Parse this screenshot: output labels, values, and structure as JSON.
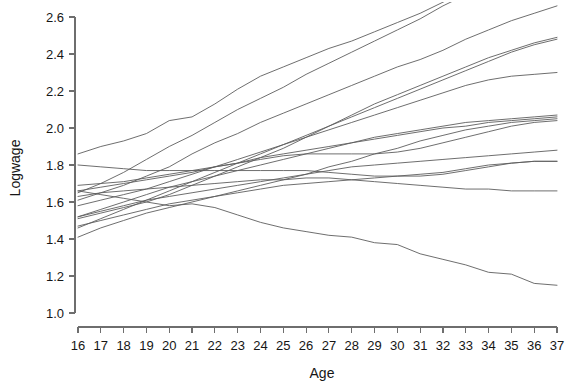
{
  "chart_data": {
    "type": "line",
    "title": "",
    "subtitle": "",
    "xlabel": "Age",
    "ylabel": "Logwage",
    "grid": false,
    "legend": "none",
    "xlim": [
      16,
      37
    ],
    "ylim": [
      1.0,
      2.6
    ],
    "y_axis_visible_max": 2.6,
    "x_ticks": [
      16,
      17,
      18,
      19,
      20,
      21,
      22,
      23,
      24,
      25,
      26,
      27,
      28,
      29,
      30,
      31,
      32,
      33,
      34,
      35,
      36,
      37
    ],
    "y_ticks": [
      1.0,
      1.2,
      1.4,
      1.6,
      1.8,
      2.0,
      2.2,
      2.4,
      2.6
    ],
    "x_tick_labels": [
      "16",
      "17",
      "18",
      "19",
      "20",
      "21",
      "22",
      "23",
      "24",
      "25",
      "26",
      "27",
      "28",
      "29",
      "30",
      "31",
      "32",
      "33",
      "34",
      "35",
      "36",
      "37"
    ],
    "y_tick_labels": [
      "1.0",
      "1.2",
      "1.4",
      "1.6",
      "1.8",
      "2.0",
      "2.2",
      "2.4",
      "2.6"
    ],
    "x": [
      16,
      17,
      18,
      19,
      20,
      21,
      22,
      23,
      24,
      25,
      26,
      27,
      28,
      29,
      30,
      31,
      32,
      33,
      34,
      35,
      36,
      37
    ],
    "line_color": "#5e5e5e",
    "series": [
      {
        "name": "subject-1",
        "values": [
          1.86,
          1.9,
          1.93,
          1.97,
          2.04,
          2.06,
          2.13,
          2.21,
          2.28,
          2.33,
          2.38,
          2.43,
          2.47,
          2.52,
          2.57,
          2.62,
          2.68,
          2.74,
          2.8,
          2.86,
          2.92,
          2.98
        ]
      },
      {
        "name": "subject-2",
        "values": [
          1.65,
          1.7,
          1.76,
          1.83,
          1.9,
          1.96,
          2.03,
          2.1,
          2.16,
          2.22,
          2.29,
          2.35,
          2.41,
          2.47,
          2.53,
          2.59,
          2.66,
          2.72,
          2.78,
          2.84,
          2.9,
          2.96
        ]
      },
      {
        "name": "subject-3",
        "values": [
          1.61,
          1.65,
          1.69,
          1.74,
          1.79,
          1.86,
          1.92,
          1.97,
          2.03,
          2.08,
          2.13,
          2.18,
          2.23,
          2.28,
          2.33,
          2.37,
          2.42,
          2.48,
          2.53,
          2.58,
          2.62,
          2.66
        ]
      },
      {
        "name": "subject-4",
        "values": [
          1.51,
          1.54,
          1.57,
          1.6,
          1.64,
          1.69,
          1.74,
          1.79,
          1.84,
          1.89,
          1.95,
          2.01,
          2.07,
          2.13,
          2.18,
          2.23,
          2.28,
          2.33,
          2.38,
          2.42,
          2.46,
          2.49
        ]
      },
      {
        "name": "subject-5",
        "values": [
          1.46,
          1.51,
          1.56,
          1.61,
          1.66,
          1.71,
          1.76,
          1.81,
          1.86,
          1.91,
          1.96,
          2.01,
          2.06,
          2.11,
          2.16,
          2.21,
          2.26,
          2.31,
          2.36,
          2.41,
          2.45,
          2.48
        ]
      },
      {
        "name": "subject-6",
        "values": [
          1.58,
          1.61,
          1.64,
          1.67,
          1.71,
          1.75,
          1.79,
          1.83,
          1.87,
          1.91,
          1.95,
          1.99,
          2.03,
          2.07,
          2.11,
          2.15,
          2.19,
          2.23,
          2.26,
          2.28,
          2.29,
          2.3
        ]
      },
      {
        "name": "subject-7",
        "values": [
          1.52,
          1.56,
          1.6,
          1.64,
          1.68,
          1.71,
          1.74,
          1.77,
          1.8,
          1.83,
          1.86,
          1.89,
          1.92,
          1.95,
          1.97,
          1.99,
          2.01,
          2.03,
          2.04,
          2.05,
          2.06,
          2.07
        ]
      },
      {
        "name": "subject-8",
        "values": [
          1.66,
          1.68,
          1.7,
          1.72,
          1.74,
          1.76,
          1.79,
          1.81,
          1.84,
          1.86,
          1.88,
          1.9,
          1.92,
          1.94,
          1.96,
          1.98,
          2.0,
          2.01,
          2.03,
          2.04,
          2.05,
          2.06
        ]
      },
      {
        "name": "subject-9",
        "values": [
          1.41,
          1.46,
          1.5,
          1.54,
          1.57,
          1.6,
          1.63,
          1.66,
          1.69,
          1.72,
          1.75,
          1.79,
          1.82,
          1.86,
          1.89,
          1.93,
          1.96,
          1.99,
          2.01,
          2.03,
          2.04,
          2.05
        ]
      },
      {
        "name": "subject-10",
        "values": [
          1.69,
          1.7,
          1.71,
          1.73,
          1.75,
          1.77,
          1.79,
          1.81,
          1.83,
          1.85,
          1.86,
          1.86,
          1.86,
          1.86,
          1.87,
          1.89,
          1.92,
          1.95,
          1.98,
          2.01,
          2.03,
          2.04
        ]
      },
      {
        "name": "subject-11",
        "values": [
          1.52,
          1.55,
          1.58,
          1.61,
          1.63,
          1.65,
          1.67,
          1.69,
          1.71,
          1.73,
          1.75,
          1.77,
          1.79,
          1.8,
          1.81,
          1.82,
          1.83,
          1.84,
          1.85,
          1.86,
          1.87,
          1.88
        ]
      },
      {
        "name": "subject-12",
        "values": [
          1.47,
          1.5,
          1.53,
          1.56,
          1.59,
          1.61,
          1.63,
          1.65,
          1.67,
          1.69,
          1.7,
          1.71,
          1.72,
          1.73,
          1.74,
          1.75,
          1.76,
          1.78,
          1.8,
          1.81,
          1.82,
          1.82
        ]
      },
      {
        "name": "subject-13",
        "values": [
          1.8,
          1.79,
          1.78,
          1.77,
          1.77,
          1.77,
          1.77,
          1.77,
          1.77,
          1.77,
          1.77,
          1.76,
          1.75,
          1.74,
          1.74,
          1.74,
          1.75,
          1.77,
          1.79,
          1.81,
          1.82,
          1.82
        ]
      },
      {
        "name": "subject-14",
        "values": [
          1.63,
          1.65,
          1.66,
          1.67,
          1.68,
          1.69,
          1.7,
          1.71,
          1.72,
          1.72,
          1.73,
          1.73,
          1.72,
          1.71,
          1.7,
          1.69,
          1.68,
          1.67,
          1.67,
          1.66,
          1.66,
          1.66
        ]
      },
      {
        "name": "subject-15",
        "values": [
          1.66,
          1.64,
          1.62,
          1.6,
          1.58,
          1.59,
          1.57,
          1.53,
          1.49,
          1.46,
          1.44,
          1.42,
          1.41,
          1.38,
          1.37,
          1.32,
          1.29,
          1.26,
          1.22,
          1.21,
          1.16,
          1.15
        ]
      }
    ]
  }
}
